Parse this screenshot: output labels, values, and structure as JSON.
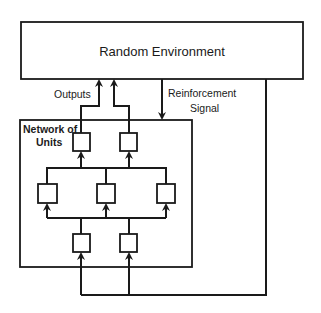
{
  "diagram": {
    "environment": {
      "label": "Random Environment"
    },
    "network": {
      "label_line1": "Network of",
      "label_line2": "Units"
    },
    "labels": {
      "outputs": "Outputs",
      "reinforcement_line1": "Reinforcement",
      "reinforcement_line2": "Signal"
    },
    "layers": {
      "top_units": 2,
      "middle_units": 3,
      "bottom_units": 2
    },
    "colors": {
      "stroke": "#1a1a1a",
      "background": "#ffffff"
    }
  }
}
